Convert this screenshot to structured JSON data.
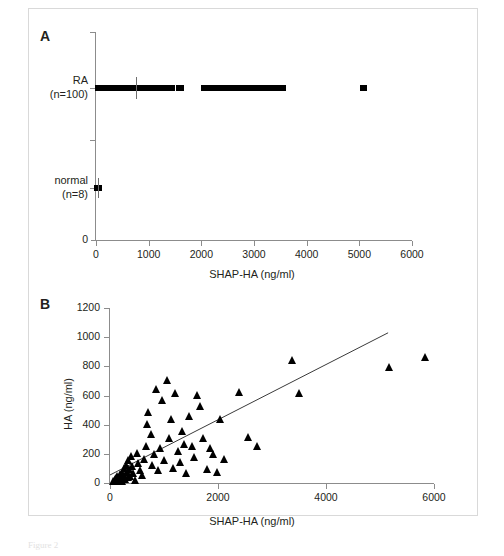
{
  "figure": {
    "caption_fragment": "Figure 2"
  },
  "panelA": {
    "letter": "A",
    "xlabel": "SHAP-HA (ng/ml)",
    "xticks": [
      0,
      1000,
      2000,
      3000,
      4000,
      5000,
      6000
    ],
    "xlim": [
      0,
      6000
    ],
    "origin_label": "0",
    "groups": [
      {
        "name": "RA",
        "count_label": "(n=100)",
        "label": "RA"
      },
      {
        "name": "normal",
        "count_label": "(n=8)",
        "label": "normal"
      }
    ],
    "chart_data": {
      "type": "scatter",
      "title": "",
      "xlabel": "SHAP-HA (ng/ml)",
      "ylabel": "",
      "xlim": [
        0,
        6000
      ],
      "grid": false,
      "legend": "none",
      "categories": [
        "RA (n=100)",
        "normal (n=8)"
      ],
      "series": [
        {
          "name": "RA (n=100)",
          "median": 760,
          "values": [
            30,
            55,
            70,
            85,
            100,
            115,
            130,
            145,
            160,
            175,
            190,
            205,
            220,
            235,
            250,
            265,
            280,
            295,
            310,
            325,
            340,
            355,
            370,
            385,
            400,
            415,
            430,
            445,
            460,
            475,
            490,
            505,
            520,
            535,
            550,
            565,
            580,
            600,
            620,
            640,
            660,
            690,
            715,
            735,
            760,
            790,
            815,
            840,
            865,
            890,
            915,
            940,
            965,
            990,
            1015,
            1040,
            1065,
            1090,
            1115,
            1140,
            1165,
            1190,
            1215,
            1240,
            1270,
            1300,
            1330,
            1360,
            1390,
            1420,
            1460,
            1560,
            1620,
            2040,
            2080,
            2140,
            2200,
            2260,
            2320,
            2380,
            2430,
            2490,
            2560,
            2620,
            2700,
            2760,
            2830,
            2900,
            2970,
            3040,
            3110,
            3180,
            3260,
            3330,
            3400,
            3470,
            3520,
            3560,
            5060,
            5100
          ]
        },
        {
          "name": "normal (n=8)",
          "median": 35,
          "values": [
            8,
            14,
            20,
            26,
            32,
            40,
            48,
            58
          ]
        }
      ]
    }
  },
  "panelB": {
    "letter": "B",
    "xlabel": "SHAP-HA (ng/ml)",
    "ylabel": "HA (ng/ml)",
    "xticks": [
      0,
      2000,
      4000,
      6000
    ],
    "yticks": [
      0,
      200,
      400,
      600,
      800,
      1000,
      1200
    ],
    "xlim": [
      0,
      6000
    ],
    "ylim": [
      0,
      1200
    ],
    "chart_data": {
      "type": "scatter",
      "title": "",
      "xlabel": "SHAP-HA (ng/ml)",
      "ylabel": "HA (ng/ml)",
      "xlim": [
        0,
        6000
      ],
      "ylim": [
        0,
        1200
      ],
      "grid": false,
      "legend": "none",
      "marker": "triangle",
      "points": [
        [
          60,
          5
        ],
        [
          80,
          10
        ],
        [
          95,
          18
        ],
        [
          110,
          8
        ],
        [
          120,
          25
        ],
        [
          135,
          15
        ],
        [
          145,
          40
        ],
        [
          155,
          22
        ],
        [
          165,
          5
        ],
        [
          175,
          30
        ],
        [
          185,
          12
        ],
        [
          195,
          55
        ],
        [
          205,
          20
        ],
        [
          215,
          38
        ],
        [
          225,
          8
        ],
        [
          240,
          60
        ],
        [
          250,
          28
        ],
        [
          260,
          95
        ],
        [
          275,
          45
        ],
        [
          290,
          18
        ],
        [
          305,
          120
        ],
        [
          320,
          70
        ],
        [
          335,
          35
        ],
        [
          350,
          150
        ],
        [
          365,
          90
        ],
        [
          380,
          40
        ],
        [
          400,
          175
        ],
        [
          420,
          110
        ],
        [
          440,
          60
        ],
        [
          470,
          15
        ],
        [
          500,
          200
        ],
        [
          530,
          130
        ],
        [
          560,
          80
        ],
        [
          600,
          45
        ],
        [
          640,
          160
        ],
        [
          680,
          250
        ],
        [
          700,
          400
        ],
        [
          720,
          480
        ],
        [
          760,
          330
        ],
        [
          790,
          120
        ],
        [
          820,
          190
        ],
        [
          860,
          640
        ],
        [
          900,
          80
        ],
        [
          940,
          230
        ],
        [
          980,
          560
        ],
        [
          1010,
          150
        ],
        [
          1060,
          700
        ],
        [
          1100,
          300
        ],
        [
          1140,
          430
        ],
        [
          1180,
          95
        ],
        [
          1220,
          610
        ],
        [
          1260,
          210
        ],
        [
          1300,
          140
        ],
        [
          1340,
          350
        ],
        [
          1380,
          260
        ],
        [
          1420,
          60
        ],
        [
          1480,
          450
        ],
        [
          1530,
          250
        ],
        [
          1570,
          170
        ],
        [
          1620,
          600
        ],
        [
          1680,
          520
        ],
        [
          1740,
          300
        ],
        [
          1800,
          90
        ],
        [
          1860,
          230
        ],
        [
          1920,
          190
        ],
        [
          1990,
          70
        ],
        [
          2050,
          430
        ],
        [
          2120,
          160
        ],
        [
          2400,
          620
        ],
        [
          2560,
          310
        ],
        [
          2740,
          250
        ],
        [
          3380,
          840
        ],
        [
          3500,
          610
        ],
        [
          5170,
          790
        ],
        [
          5850,
          860
        ]
      ],
      "regression_line": {
        "x_start": 0,
        "y_start": 55,
        "x_end": 5150,
        "y_end": 1030,
        "slope": 0.1893,
        "intercept": 55
      }
    }
  }
}
